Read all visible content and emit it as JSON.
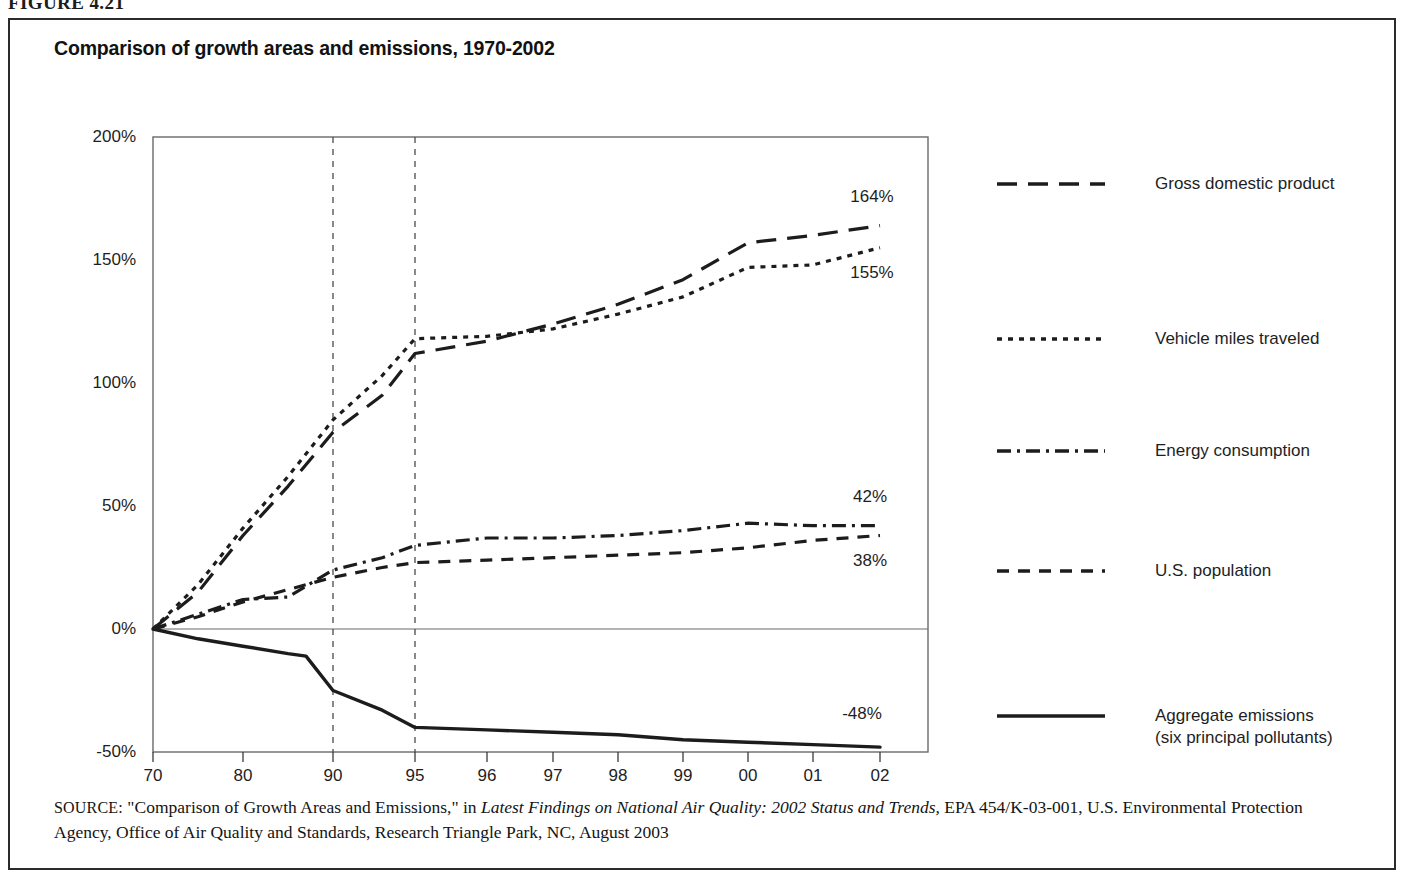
{
  "figure": {
    "number": "FIGURE 4.21"
  },
  "chart_title": "Comparison of growth areas and emissions, 1970-2002",
  "legend": {
    "items": [
      {
        "label": "Gross domestic product",
        "style": "long-dash"
      },
      {
        "label": "Vehicle miles traveled",
        "style": "dotted"
      },
      {
        "label": "Energy consumption",
        "style": "dash-dot"
      },
      {
        "label": "U.S. population",
        "style": "medium-dash"
      },
      {
        "label": "Aggregate emissions\n(six principal pollutants)",
        "style": "solid"
      }
    ]
  },
  "source": {
    "prefix": "SOURCE:",
    "part1": " \"Comparison of Growth Areas and Emissions,\" in ",
    "italic": "Latest Findings on National Air Quality: 2002 Status and Trends,",
    "part2": " EPA 454/K-03-001, U.S. Environmental Protection Agency, Office of Air Quality and Standards, Research Triangle Park, NC, August 2003"
  },
  "chart_data": {
    "type": "line",
    "title": "Comparison of growth areas and emissions, 1970-2002",
    "xlabel": "",
    "ylabel": "",
    "ylim": [
      -50,
      200
    ],
    "yticks": [
      200,
      150,
      100,
      50,
      0,
      -50
    ],
    "ytick_labels": [
      "200%",
      "150%",
      "100%",
      "50%",
      "0%",
      "-50%"
    ],
    "x_tick_labels": [
      "70",
      "80",
      "90",
      "95",
      "96",
      "97",
      "98",
      "99",
      "00",
      "01",
      "02"
    ],
    "x_tick_values": [
      1970,
      1980,
      1990,
      1995,
      1996,
      1997,
      1998,
      1999,
      2000,
      2001,
      2002
    ],
    "grid": "vertical dashed at 1990 and 1995; horizontal solid zero line",
    "legend_position": "right",
    "note": "Percent change from 1970 baseline",
    "series": [
      {
        "name": "Gross domestic product",
        "style": "long-dash",
        "end_label": "164%",
        "points": [
          {
            "x": 1970,
            "y": 0
          },
          {
            "x": 1975,
            "y": 15
          },
          {
            "x": 1980,
            "y": 38
          },
          {
            "x": 1985,
            "y": 58
          },
          {
            "x": 1990,
            "y": 80
          },
          {
            "x": 1993,
            "y": 95
          },
          {
            "x": 1995,
            "y": 112
          },
          {
            "x": 1996,
            "y": 117
          },
          {
            "x": 1997,
            "y": 124
          },
          {
            "x": 1998,
            "y": 132
          },
          {
            "x": 1999,
            "y": 142
          },
          {
            "x": 2000,
            "y": 157
          },
          {
            "x": 2001,
            "y": 160
          },
          {
            "x": 2002,
            "y": 164
          }
        ]
      },
      {
        "name": "Vehicle miles traveled",
        "style": "dotted",
        "end_label": "155%",
        "points": [
          {
            "x": 1970,
            "y": 0
          },
          {
            "x": 1975,
            "y": 18
          },
          {
            "x": 1980,
            "y": 41
          },
          {
            "x": 1985,
            "y": 62
          },
          {
            "x": 1990,
            "y": 85
          },
          {
            "x": 1993,
            "y": 103
          },
          {
            "x": 1995,
            "y": 118
          },
          {
            "x": 1996,
            "y": 119
          },
          {
            "x": 1997,
            "y": 122
          },
          {
            "x": 1998,
            "y": 128
          },
          {
            "x": 1999,
            "y": 135
          },
          {
            "x": 2000,
            "y": 147
          },
          {
            "x": 2001,
            "y": 148
          },
          {
            "x": 2002,
            "y": 155
          }
        ]
      },
      {
        "name": "Energy consumption",
        "style": "dash-dot",
        "end_label": "42%",
        "points": [
          {
            "x": 1970,
            "y": 0
          },
          {
            "x": 1975,
            "y": 6
          },
          {
            "x": 1980,
            "y": 12
          },
          {
            "x": 1985,
            "y": 13
          },
          {
            "x": 1990,
            "y": 24
          },
          {
            "x": 1993,
            "y": 29
          },
          {
            "x": 1995,
            "y": 34
          },
          {
            "x": 1996,
            "y": 37
          },
          {
            "x": 1997,
            "y": 37
          },
          {
            "x": 1998,
            "y": 38
          },
          {
            "x": 1999,
            "y": 40
          },
          {
            "x": 2000,
            "y": 43
          },
          {
            "x": 2001,
            "y": 42
          },
          {
            "x": 2002,
            "y": 42
          }
        ]
      },
      {
        "name": "U.S. population",
        "style": "medium-dash",
        "end_label": "38%",
        "points": [
          {
            "x": 1970,
            "y": 0
          },
          {
            "x": 1975,
            "y": 5
          },
          {
            "x": 1980,
            "y": 11
          },
          {
            "x": 1985,
            "y": 16
          },
          {
            "x": 1990,
            "y": 21
          },
          {
            "x": 1993,
            "y": 25
          },
          {
            "x": 1995,
            "y": 27
          },
          {
            "x": 1996,
            "y": 28
          },
          {
            "x": 1997,
            "y": 29
          },
          {
            "x": 1998,
            "y": 30
          },
          {
            "x": 1999,
            "y": 31
          },
          {
            "x": 2000,
            "y": 33
          },
          {
            "x": 2001,
            "y": 36
          },
          {
            "x": 2002,
            "y": 38
          }
        ]
      },
      {
        "name": "Aggregate emissions (six principal pollutants)",
        "style": "solid",
        "end_label": "-48%",
        "points": [
          {
            "x": 1970,
            "y": 0
          },
          {
            "x": 1975,
            "y": -4
          },
          {
            "x": 1980,
            "y": -7
          },
          {
            "x": 1985,
            "y": -10
          },
          {
            "x": 1987,
            "y": -11
          },
          {
            "x": 1990,
            "y": -25
          },
          {
            "x": 1993,
            "y": -33
          },
          {
            "x": 1995,
            "y": -40
          },
          {
            "x": 1996,
            "y": -41
          },
          {
            "x": 1997,
            "y": -42
          },
          {
            "x": 1998,
            "y": -43
          },
          {
            "x": 1999,
            "y": -45
          },
          {
            "x": 2000,
            "y": -46
          },
          {
            "x": 2001,
            "y": -47
          },
          {
            "x": 2002,
            "y": -48
          }
        ]
      }
    ]
  }
}
